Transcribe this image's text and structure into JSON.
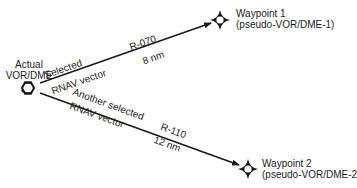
{
  "diagram": {
    "origin": {
      "label_line1": "Actual",
      "label_line2": "VOR/DME",
      "icon": "vor-dme-hexagon-icon"
    },
    "waypoints": [
      {
        "name": "Waypoint 1",
        "sublabel": "(pseudo-VOR/DME-1)",
        "icon": "waypoint-star-icon"
      },
      {
        "name": "Waypoint 2",
        "sublabel": "(pseudo-VOR/DME-2",
        "icon": "waypoint-star-icon"
      }
    ],
    "vectors": [
      {
        "label_above": "Selected",
        "label_below": "RNAV vector",
        "radial": "R-070",
        "distance": "8 nm"
      },
      {
        "label_above": "Another selected",
        "label_below": "RNAV vector",
        "radial": "R-110",
        "distance": "12 nm"
      }
    ],
    "colors": {
      "line": "#1a1a1a",
      "background": "#ffffff"
    }
  }
}
